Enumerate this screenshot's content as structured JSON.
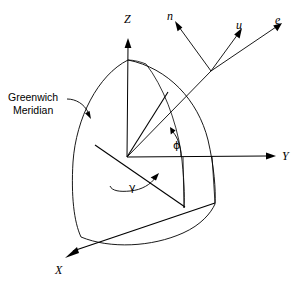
{
  "figure": {
    "kind": "3d-geocentric-coordinate-diagram",
    "background_color": "#ffffff",
    "stroke_color": "#000000",
    "width": 306,
    "height": 287
  },
  "axes": [
    {
      "id": "z",
      "label": "Z",
      "label_x": 124,
      "label_y": 13,
      "direction": "up"
    },
    {
      "id": "y",
      "label": "Y",
      "label_x": 282,
      "label_y": 150,
      "direction": "right"
    },
    {
      "id": "x",
      "label": "X",
      "label_x": 55,
      "label_y": 264,
      "direction": "down-left"
    }
  ],
  "local_frame_vectors": [
    {
      "id": "n",
      "label": "n",
      "label_x": 167,
      "label_y": 10,
      "description": "north unit vector"
    },
    {
      "id": "u",
      "label": "u",
      "label_x": 236,
      "label_y": 19,
      "description": "up unit vector"
    },
    {
      "id": "e",
      "label": "e",
      "label_x": 275,
      "label_y": 14,
      "description": "east unit vector"
    }
  ],
  "angles": [
    {
      "id": "phi",
      "label": "ϕ",
      "label_x": 173,
      "label_y": 140,
      "description": "latitude angle phi"
    },
    {
      "id": "gamma",
      "label": "γ",
      "label_x": 129,
      "label_y": 182,
      "description": "longitude angle gamma"
    }
  ],
  "annotations": [
    {
      "id": "greenwich-meridian",
      "line1": "Greenwich",
      "line2": "Meridian",
      "x": 8,
      "y": 91,
      "description": "callout pointing to the left meridian arc"
    }
  ]
}
